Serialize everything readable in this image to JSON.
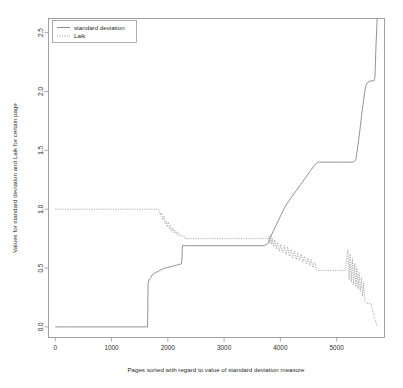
{
  "chart_data": {
    "type": "line",
    "title": "",
    "subtitle": "",
    "xlabel": "Pages sorted with regard to value of standard deviation measure",
    "ylabel": "Values for standard deviation and Laik for certain page",
    "xlim": [
      -120,
      5850
    ],
    "ylim": [
      -0.09,
      2.62
    ],
    "xticks": [
      0,
      1000,
      2000,
      3000,
      4000,
      5000
    ],
    "xtick_labels": [
      "0",
      "1000",
      "2000",
      "3000",
      "4000",
      "5000"
    ],
    "yticks": [
      0.0,
      0.5,
      1.0,
      1.5,
      2.0,
      2.5
    ],
    "ytick_labels": [
      "0.0",
      "0.5",
      "1.0",
      "1.5",
      "2.0",
      "2.5"
    ],
    "grid": false,
    "legend_position": "top-left",
    "legend": [
      {
        "name": "standard deviation",
        "style": "solid",
        "color": "#6f6f6f"
      },
      {
        "name": "Laik",
        "style": "dotted",
        "color": "#8c8c8c"
      }
    ],
    "series": [
      {
        "name": "standard deviation",
        "style": "solid",
        "color": "#6f6f6f",
        "x": [
          0,
          200,
          500,
          900,
          1300,
          1600,
          1640,
          1650,
          1660,
          1680,
          1700,
          1720,
          1760,
          1800,
          1840,
          1870,
          1900,
          1940,
          1980,
          2020,
          2060,
          2100,
          2140,
          2180,
          2200,
          2220,
          2240,
          2250,
          2260,
          2300,
          2340,
          2380,
          2500,
          2700,
          2900,
          3100,
          3300,
          3500,
          3700,
          3760,
          3790,
          3800,
          3820,
          3850,
          3880,
          3920,
          3960,
          4000,
          4060,
          4120,
          4180,
          4240,
          4300,
          4360,
          4420,
          4480,
          4540,
          4600,
          4640,
          4680,
          4700,
          4760,
          4820,
          4880,
          4940,
          5000,
          5060,
          5120,
          5180,
          5240,
          5300,
          5340,
          5360,
          5380,
          5400,
          5420,
          5440,
          5460,
          5480,
          5500,
          5520,
          5560,
          5600,
          5640,
          5660,
          5680,
          5700,
          5720
        ],
        "y": [
          0.0,
          0.0,
          0.0,
          0.0,
          0.0,
          0.0,
          0.0,
          0.37,
          0.39,
          0.41,
          0.42,
          0.44,
          0.455,
          0.465,
          0.475,
          0.482,
          0.49,
          0.497,
          0.503,
          0.508,
          0.513,
          0.518,
          0.523,
          0.528,
          0.53,
          0.532,
          0.535,
          0.565,
          0.69,
          0.69,
          0.69,
          0.69,
          0.69,
          0.69,
          0.69,
          0.69,
          0.69,
          0.69,
          0.69,
          0.7,
          0.715,
          0.74,
          0.76,
          0.79,
          0.82,
          0.86,
          0.9,
          0.94,
          1.0,
          1.05,
          1.09,
          1.13,
          1.17,
          1.21,
          1.25,
          1.29,
          1.33,
          1.37,
          1.39,
          1.4,
          1.4,
          1.4,
          1.4,
          1.4,
          1.4,
          1.4,
          1.4,
          1.4,
          1.4,
          1.4,
          1.4,
          1.42,
          1.48,
          1.55,
          1.62,
          1.7,
          1.78,
          1.86,
          1.93,
          2.0,
          2.05,
          2.08,
          2.09,
          2.09,
          2.09,
          2.12,
          2.4,
          2.62
        ]
      },
      {
        "name": "Laik",
        "style": "dotted",
        "color": "#8c8c8c",
        "description": "Dotted series starting at 1.0, flat until ~1850, noisy decline to ~0.75 plateau by ~2300, flat at 0.75 until ~3800, then dense noisy scatter declining to ~0.48 plateau by ~4650, gap, resumes ~5200 with dense scatter falling to ~0.20, ending near 0.0 at the right edge",
        "x": [
          0,
          300,
          700,
          1100,
          1500,
          1820,
          1850,
          1870,
          1890,
          1910,
          1930,
          1950,
          1970,
          1990,
          2010,
          2030,
          2050,
          2070,
          2090,
          2110,
          2130,
          2150,
          2170,
          2190,
          2210,
          2230,
          2250,
          2270,
          2290,
          2310,
          2400,
          2700,
          3000,
          3300,
          3600,
          3780,
          3800,
          3815,
          3830,
          3845,
          3860,
          3880,
          3900,
          3925,
          3950,
          3980,
          4010,
          4040,
          4070,
          4100,
          4130,
          4160,
          4190,
          4220,
          4250,
          4280,
          4310,
          4340,
          4370,
          4400,
          4430,
          4460,
          4490,
          4520,
          4550,
          4580,
          4610,
          4640,
          4660,
          4900,
          5150,
          5200,
          5220,
          5240,
          5260,
          5280,
          5300,
          5320,
          5340,
          5360,
          5380,
          5400,
          5420,
          5440,
          5460,
          5480,
          5500,
          5530,
          5570,
          5610,
          5650,
          5690,
          5720
        ],
        "y": [
          1.0,
          1.0,
          1.0,
          1.0,
          1.0,
          1.0,
          0.99,
          0.95,
          0.97,
          0.91,
          0.94,
          0.88,
          0.9,
          0.85,
          0.89,
          0.83,
          0.86,
          0.81,
          0.84,
          0.8,
          0.82,
          0.785,
          0.81,
          0.775,
          0.79,
          0.77,
          0.78,
          0.765,
          0.775,
          0.75,
          0.75,
          0.75,
          0.75,
          0.75,
          0.75,
          0.75,
          0.77,
          0.71,
          0.78,
          0.7,
          0.75,
          0.68,
          0.74,
          0.66,
          0.72,
          0.64,
          0.7,
          0.63,
          0.69,
          0.61,
          0.68,
          0.6,
          0.66,
          0.585,
          0.645,
          0.575,
          0.63,
          0.565,
          0.62,
          0.55,
          0.6,
          0.535,
          0.585,
          0.52,
          0.57,
          0.505,
          0.55,
          0.49,
          0.48,
          0.48,
          0.48,
          0.66,
          0.4,
          0.62,
          0.38,
          0.58,
          0.36,
          0.54,
          0.34,
          0.5,
          0.32,
          0.46,
          0.3,
          0.42,
          0.26,
          0.38,
          0.22,
          0.2,
          0.2,
          0.2,
          0.12,
          0.05,
          0.0
        ]
      }
    ]
  },
  "axes": {
    "x_title": "Pages sorted with regard to value of standard deviation measure",
    "y_title": "Values for standard deviation and Laik for certain page"
  },
  "legend": {
    "entry_sd": "standard deviation",
    "entry_laik": "Laik"
  },
  "colors": {
    "background": "#ffffff",
    "frame": "#8a8a8a",
    "series_sd": "#6f6f6f",
    "series_laik": "#8c8c8c",
    "text": "#2b2b2b"
  }
}
